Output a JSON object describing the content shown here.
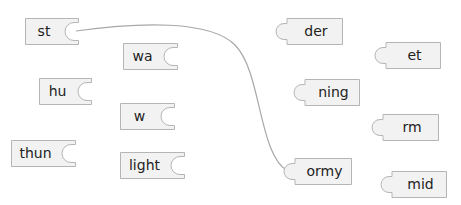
{
  "game": {
    "type": "word-matching-puzzle",
    "left_pieces": [
      {
        "label": "st",
        "x": 25,
        "y": 18,
        "w": 54
      },
      {
        "label": "wa",
        "x": 123,
        "y": 43,
        "w": 55
      },
      {
        "label": "hu",
        "x": 39,
        "y": 78,
        "w": 53
      },
      {
        "label": "w",
        "x": 120,
        "y": 103,
        "w": 55
      },
      {
        "label": "thun",
        "x": 11,
        "y": 140,
        "w": 65
      },
      {
        "label": "light",
        "x": 120,
        "y": 152,
        "w": 65
      }
    ],
    "right_pieces": [
      {
        "label": "der",
        "x": 275,
        "y": 18,
        "w": 68
      },
      {
        "label": "et",
        "x": 374,
        "y": 42,
        "w": 67
      },
      {
        "label": "ning",
        "x": 293,
        "y": 79,
        "w": 67
      },
      {
        "label": "rm",
        "x": 371,
        "y": 114,
        "w": 68
      },
      {
        "label": "ormy",
        "x": 283,
        "y": 158,
        "w": 69
      },
      {
        "label": "mid",
        "x": 380,
        "y": 171,
        "w": 67
      }
    ],
    "connections": [
      {
        "from": "st",
        "to": "ormy"
      }
    ],
    "colors": {
      "piece_fill": "#f2f2f2",
      "piece_border": "#b5b5b5",
      "line": "#a8a8a8",
      "text": "#222222"
    }
  }
}
